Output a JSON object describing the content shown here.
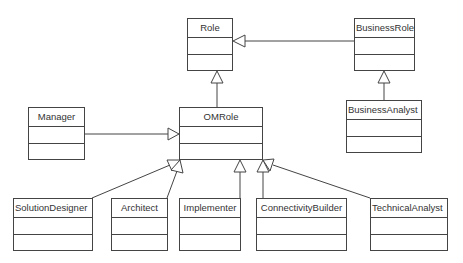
{
  "diagram": {
    "type": "UML class diagram",
    "classes": [
      {
        "id": "role",
        "name": "Role",
        "x": 187,
        "y": 18,
        "w": 46,
        "h": 53,
        "align": "center"
      },
      {
        "id": "businessrole",
        "name": "BusinessRole",
        "x": 354,
        "y": 18,
        "w": 61,
        "h": 53,
        "align": "left"
      },
      {
        "id": "businessanalyst",
        "name": "BusinessAnalyst",
        "x": 346,
        "y": 100,
        "w": 76,
        "h": 53,
        "align": "left"
      },
      {
        "id": "manager",
        "name": "Manager",
        "x": 28,
        "y": 107,
        "w": 57,
        "h": 53,
        "align": "center"
      },
      {
        "id": "omrole",
        "name": "OMRole",
        "x": 179,
        "y": 107,
        "w": 84,
        "h": 53,
        "align": "center"
      },
      {
        "id": "solutiondesigner",
        "name": "SolutionDesigner",
        "x": 13,
        "y": 198,
        "w": 80,
        "h": 53,
        "align": "left"
      },
      {
        "id": "architect",
        "name": "Architect",
        "x": 111,
        "y": 198,
        "w": 57,
        "h": 53,
        "align": "center"
      },
      {
        "id": "implementer",
        "name": "Implementer",
        "x": 179,
        "y": 198,
        "w": 62,
        "h": 53,
        "align": "center"
      },
      {
        "id": "connectivitybuilder",
        "name": "ConnectivityBuilder",
        "x": 256,
        "y": 198,
        "w": 91,
        "h": 53,
        "align": "center"
      },
      {
        "id": "technicalanalyst",
        "name": "TechnicalAnalyst",
        "x": 370,
        "y": 198,
        "w": 78,
        "h": 53,
        "align": "left"
      }
    ],
    "generalizations": [
      {
        "from": "BusinessRole",
        "to": "Role"
      },
      {
        "from": "OMRole",
        "to": "Role"
      },
      {
        "from": "BusinessAnalyst",
        "to": "BusinessRole"
      },
      {
        "from": "Manager",
        "to": "OMRole"
      },
      {
        "from": "SolutionDesigner",
        "to": "OMRole"
      },
      {
        "from": "Architect",
        "to": "OMRole"
      },
      {
        "from": "Implementer",
        "to": "OMRole"
      },
      {
        "from": "ConnectivityBuilder",
        "to": "OMRole"
      },
      {
        "from": "TechnicalAnalyst",
        "to": "OMRole"
      }
    ],
    "colors": {
      "line": "#444444",
      "text": "#333333",
      "background": "#ffffff"
    }
  }
}
